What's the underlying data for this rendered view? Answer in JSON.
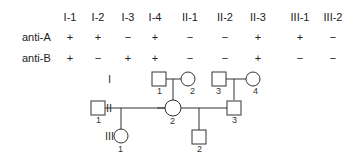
{
  "table": {
    "columns": [
      "I-1",
      "I-2",
      "I-3",
      "I-4",
      "II-1",
      "II-2",
      "II-3",
      "III-1",
      "III-2"
    ],
    "rows": [
      {
        "label": "anti-A",
        "values": [
          "+",
          "+",
          "−",
          "+",
          "−",
          "−",
          "+",
          "+",
          "−"
        ]
      },
      {
        "label": "anti-B",
        "values": [
          "+",
          "−",
          "+",
          "+",
          "−",
          "−",
          "+",
          "−",
          "−"
        ]
      }
    ]
  },
  "pedigree": {
    "generations": [
      "I",
      "II",
      "III"
    ],
    "individuals": {
      "I-1": "1",
      "I-2": "2",
      "I-3": "3",
      "I-4": "4",
      "II-1": "1",
      "II-2": "2",
      "II-3": "3",
      "III-1": "1",
      "III-2": "2"
    }
  }
}
